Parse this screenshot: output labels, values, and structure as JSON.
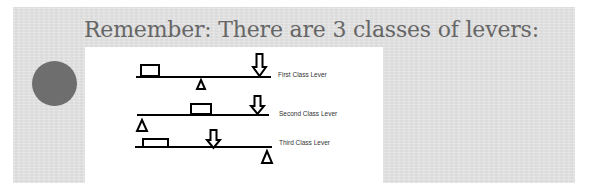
{
  "slide": {
    "title": "Remember: There are 3 classes of levers:",
    "background_color": "#e3e3e3",
    "title_color": "#666666",
    "bullet_circle_color": "#6e6e6e"
  },
  "diagram": {
    "background_color": "#ffffff",
    "stroke_color": "#000000",
    "levers": [
      {
        "label": "First Class Lever",
        "description": "fulcrum between load and effort"
      },
      {
        "label": "Second Class Lever",
        "description": "load between fulcrum and effort"
      },
      {
        "label": "Third Class Lever",
        "description": "effort between load and fulcrum"
      }
    ]
  }
}
